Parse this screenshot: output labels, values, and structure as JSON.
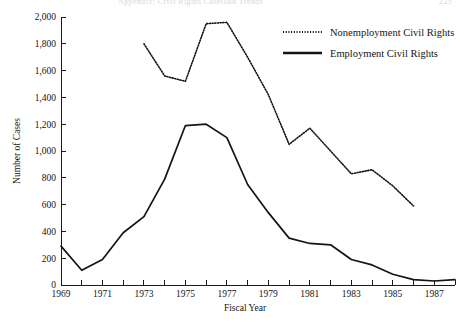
{
  "page": {
    "running_head": "Appendix: Civil Rights Caseload Trends",
    "folio": "225"
  },
  "chart_data": {
    "type": "line",
    "title": "",
    "xlabel": "Fiscal Year",
    "ylabel": "Number of Cases",
    "xlim": [
      1969,
      1988
    ],
    "ylim": [
      0,
      2000
    ],
    "ytick_step": 200,
    "yticks": [
      0,
      200,
      400,
      600,
      800,
      1000,
      1200,
      1400,
      1600,
      1800,
      2000
    ],
    "ytick_labels": [
      "0",
      "200",
      "400",
      "600",
      "800",
      "1,000",
      "1,200",
      "1,400",
      "1,600",
      "1,800",
      "2,000"
    ],
    "xticks": [
      1969,
      1970,
      1971,
      1972,
      1973,
      1974,
      1975,
      1976,
      1977,
      1978,
      1979,
      1980,
      1981,
      1982,
      1983,
      1984,
      1985,
      1986,
      1987,
      1988
    ],
    "xtick_labels_shown": [
      "1969",
      "1971",
      "1973",
      "1975",
      "1977",
      "1979",
      "1981",
      "1983",
      "1985",
      "1987"
    ],
    "grid": false,
    "legend_position": "top-right",
    "series": [
      {
        "name": "Nonemployment Civil Rights",
        "style": "dotted",
        "color": "#141414",
        "x": [
          1973,
          1974,
          1975,
          1976,
          1977,
          1978,
          1979,
          1980,
          1981,
          1982,
          1983,
          1984,
          1985,
          1986
        ],
        "values": [
          1800,
          1560,
          1520,
          1950,
          1960,
          1700,
          1420,
          1050,
          1170,
          1000,
          830,
          860,
          740,
          590
        ]
      },
      {
        "name": "Employment Civil Rights",
        "style": "solid",
        "color": "#141414",
        "x": [
          1969,
          1970,
          1971,
          1972,
          1973,
          1974,
          1975,
          1976,
          1977,
          1978,
          1979,
          1980,
          1981,
          1982,
          1983,
          1984,
          1985,
          1986,
          1987,
          1988
        ],
        "values": [
          290,
          110,
          190,
          390,
          510,
          790,
          1190,
          1200,
          1100,
          750,
          540,
          350,
          310,
          300,
          190,
          150,
          80,
          40,
          30,
          40
        ]
      }
    ]
  },
  "legend": {
    "items": [
      {
        "label": "Nonemployment Civil Rights",
        "style": "dotted"
      },
      {
        "label": "Employment Civil Rights",
        "style": "solid"
      }
    ]
  }
}
